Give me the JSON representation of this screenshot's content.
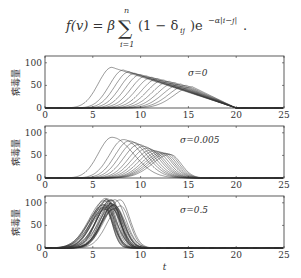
{
  "formula": {
    "lhs": "f(v) = β",
    "sum_upper": "n",
    "sum_lower": "i=1",
    "body": "(1 − δ",
    "sub": "ij",
    "body2": ")e",
    "exp": "−α|i−j|",
    "tail": "."
  },
  "chart_data": [
    {
      "type": "line",
      "title": "σ=0",
      "annotation": "σ=0",
      "xlabel": "",
      "ylabel": "病毒量",
      "xlim": [
        0,
        25
      ],
      "ylim": [
        0,
        115
      ],
      "xticks": [
        0,
        5,
        10,
        15,
        20,
        25
      ],
      "yticks": [
        0,
        50,
        100
      ],
      "series_count": 14,
      "peak_times": [
        7.0,
        8.2,
        8.8,
        9.4,
        10.0,
        10.6,
        11.2,
        11.8,
        12.4,
        13.0,
        13.6,
        14.2,
        14.8,
        15.4
      ],
      "peak_values": [
        90,
        84,
        80,
        77,
        74,
        71,
        68,
        65,
        62,
        59,
        56,
        53,
        50,
        47
      ],
      "end_time": 20
    },
    {
      "type": "line",
      "title": "σ=0.005",
      "annotation": "σ=0.005",
      "xlabel": "",
      "ylabel": "病毒量",
      "xlim": [
        0,
        25
      ],
      "ylim": [
        0,
        115
      ],
      "xticks": [
        0,
        5,
        10,
        15,
        20,
        25
      ],
      "yticks": [
        0,
        50,
        100
      ],
      "series_count": 14,
      "peak_times": [
        7.0,
        8.2,
        8.8,
        9.3,
        9.8,
        10.3,
        10.7,
        11.1,
        11.5,
        11.9,
        12.2,
        12.5,
        12.8,
        13.1
      ],
      "peak_values": [
        90,
        85,
        82,
        78,
        74,
        70,
        66,
        62,
        60,
        58,
        56,
        55,
        54,
        52
      ],
      "end_time": 17
    },
    {
      "type": "line",
      "title": "σ=0.5",
      "annotation": "σ=0.5",
      "xlabel": "t",
      "ylabel": "病毒量",
      "xlim": [
        0,
        25
      ],
      "ylim": [
        0,
        115
      ],
      "xticks": [
        0,
        5,
        10,
        15,
        20,
        25
      ],
      "yticks": [
        0,
        50,
        100
      ],
      "series_count": 30,
      "peak_time_range": [
        6.0,
        8.0
      ],
      "peak_value_range": [
        85,
        110
      ],
      "end_time": 11
    }
  ]
}
